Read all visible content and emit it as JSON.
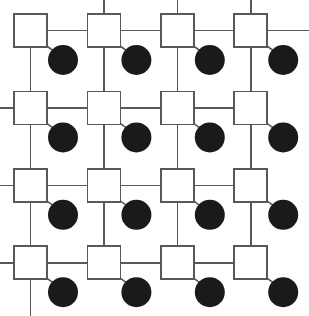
{
  "figure": {
    "type": "node-link-diagram",
    "background_color": "#ffffff",
    "canvas": {
      "width": 309,
      "height": 316
    }
  },
  "style": {
    "line_color": "#58585a",
    "line_width": 1.6,
    "square_fill": "#ffffff",
    "square_stroke": "#58585a",
    "square_stroke_width": 1.7,
    "circle_fill": "#1a1a1a"
  },
  "geometry": {
    "rows": 4,
    "cols": 4,
    "square_size": 33,
    "circle_diameter": 30,
    "origin_x": 14,
    "origin_y": 14,
    "col_pitch": 73.4,
    "row_pitch": 77.4,
    "circle_offset_x": 49,
    "circle_offset_y": 46
  },
  "nodes": {
    "squares": [
      {
        "id": "sq-r1c1",
        "row": 1,
        "col": 1,
        "x": 14,
        "y": 14
      },
      {
        "id": "sq-r1c2",
        "row": 1,
        "col": 2,
        "x": 87.4,
        "y": 14
      },
      {
        "id": "sq-r1c3",
        "row": 1,
        "col": 3,
        "x": 160.8,
        "y": 14
      },
      {
        "id": "sq-r1c4",
        "row": 1,
        "col": 4,
        "x": 234.2,
        "y": 14
      },
      {
        "id": "sq-r2c1",
        "row": 2,
        "col": 1,
        "x": 14,
        "y": 91.4
      },
      {
        "id": "sq-r2c2",
        "row": 2,
        "col": 2,
        "x": 87.4,
        "y": 91.4
      },
      {
        "id": "sq-r2c3",
        "row": 2,
        "col": 3,
        "x": 160.8,
        "y": 91.4
      },
      {
        "id": "sq-r2c4",
        "row": 2,
        "col": 4,
        "x": 234.2,
        "y": 91.4
      },
      {
        "id": "sq-r3c1",
        "row": 3,
        "col": 1,
        "x": 14,
        "y": 168.8
      },
      {
        "id": "sq-r3c2",
        "row": 3,
        "col": 2,
        "x": 87.4,
        "y": 168.8
      },
      {
        "id": "sq-r3c3",
        "row": 3,
        "col": 3,
        "x": 160.8,
        "y": 168.8
      },
      {
        "id": "sq-r3c4",
        "row": 3,
        "col": 4,
        "x": 234.2,
        "y": 168.8
      },
      {
        "id": "sq-r4c1",
        "row": 4,
        "col": 1,
        "x": 14,
        "y": 246.2
      },
      {
        "id": "sq-r4c2",
        "row": 4,
        "col": 2,
        "x": 87.4,
        "y": 246.2
      },
      {
        "id": "sq-r4c3",
        "row": 4,
        "col": 3,
        "x": 160.8,
        "y": 246.2
      },
      {
        "id": "sq-r4c4",
        "row": 4,
        "col": 4,
        "x": 234.2,
        "y": 246.2
      }
    ],
    "circles": [
      {
        "id": "ci-r1c1",
        "row": 1,
        "col": 1,
        "cx": 63,
        "cy": 60
      },
      {
        "id": "ci-r1c2",
        "row": 1,
        "col": 2,
        "cx": 136.4,
        "cy": 60
      },
      {
        "id": "ci-r1c3",
        "row": 1,
        "col": 3,
        "cx": 209.8,
        "cy": 60
      },
      {
        "id": "ci-r1c4",
        "row": 1,
        "col": 4,
        "cx": 283.2,
        "cy": 60
      },
      {
        "id": "ci-r2c1",
        "row": 2,
        "col": 1,
        "cx": 63,
        "cy": 137.4
      },
      {
        "id": "ci-r2c2",
        "row": 2,
        "col": 2,
        "cx": 136.4,
        "cy": 137.4
      },
      {
        "id": "ci-r2c3",
        "row": 2,
        "col": 3,
        "cx": 209.8,
        "cy": 137.4
      },
      {
        "id": "ci-r2c4",
        "row": 2,
        "col": 4,
        "cx": 283.2,
        "cy": 137.4
      },
      {
        "id": "ci-r3c1",
        "row": 3,
        "col": 1,
        "cx": 63,
        "cy": 214.8
      },
      {
        "id": "ci-r3c2",
        "row": 3,
        "col": 2,
        "cx": 136.4,
        "cy": 214.8
      },
      {
        "id": "ci-r3c3",
        "row": 3,
        "col": 3,
        "cx": 209.8,
        "cy": 214.8
      },
      {
        "id": "ci-r3c4",
        "row": 3,
        "col": 4,
        "cx": 283.2,
        "cy": 214.8
      },
      {
        "id": "ci-r4c1",
        "row": 4,
        "col": 1,
        "cx": 63,
        "cy": 292.2
      },
      {
        "id": "ci-r4c2",
        "row": 4,
        "col": 2,
        "cx": 136.4,
        "cy": 292.2
      },
      {
        "id": "ci-r4c3",
        "row": 4,
        "col": 3,
        "cx": 209.8,
        "cy": 292.2
      },
      {
        "id": "ci-r4c4",
        "row": 4,
        "col": 4,
        "cx": 283.2,
        "cy": 292.2
      }
    ]
  },
  "edges": {
    "horizontal": [
      {
        "id": "h-r1c1",
        "x1": 47,
        "y1": 30.5,
        "x2": 87.4,
        "y2": 30.5
      },
      {
        "id": "h-r1c2",
        "x1": 120.4,
        "y1": 30.5,
        "x2": 160.8,
        "y2": 30.5
      },
      {
        "id": "h-r1c3",
        "x1": 193.8,
        "y1": 30.5,
        "x2": 234.2,
        "y2": 30.5
      },
      {
        "id": "h-r1c4",
        "x1": 267.2,
        "y1": 30.5,
        "x2": 309,
        "y2": 30.5
      },
      {
        "id": "h-r2c0",
        "x1": 0,
        "y1": 107.9,
        "x2": 14,
        "y2": 107.9
      },
      {
        "id": "h-r2c1",
        "x1": 47,
        "y1": 107.9,
        "x2": 87.4,
        "y2": 107.9
      },
      {
        "id": "h-r2c2",
        "x1": 120.4,
        "y1": 107.9,
        "x2": 160.8,
        "y2": 107.9
      },
      {
        "id": "h-r2c3",
        "x1": 193.8,
        "y1": 107.9,
        "x2": 234.2,
        "y2": 107.9
      },
      {
        "id": "h-r3c0",
        "x1": 0,
        "y1": 185.3,
        "x2": 14,
        "y2": 185.3
      },
      {
        "id": "h-r3c1",
        "x1": 47,
        "y1": 185.3,
        "x2": 87.4,
        "y2": 185.3
      },
      {
        "id": "h-r3c2",
        "x1": 120.4,
        "y1": 185.3,
        "x2": 160.8,
        "y2": 185.3
      },
      {
        "id": "h-r3c3",
        "x1": 193.8,
        "y1": 185.3,
        "x2": 234.2,
        "y2": 185.3
      },
      {
        "id": "h-r4c0",
        "x1": 0,
        "y1": 262.7,
        "x2": 14,
        "y2": 262.7
      },
      {
        "id": "h-r4c1",
        "x1": 47,
        "y1": 262.7,
        "x2": 87.4,
        "y2": 262.7
      },
      {
        "id": "h-r4c2",
        "x1": 120.4,
        "y1": 262.7,
        "x2": 160.8,
        "y2": 262.7
      },
      {
        "id": "h-r4c3",
        "x1": 193.8,
        "y1": 262.7,
        "x2": 234.2,
        "y2": 262.7
      }
    ],
    "vertical": [
      {
        "id": "v-c1r1",
        "x1": 30.5,
        "y1": 47,
        "x2": 30.5,
        "y2": 91.4
      },
      {
        "id": "v-c1r2",
        "x1": 30.5,
        "y1": 124.4,
        "x2": 30.5,
        "y2": 168.8
      },
      {
        "id": "v-c1r3",
        "x1": 30.5,
        "y1": 201.8,
        "x2": 30.5,
        "y2": 246.2
      },
      {
        "id": "v-c1r4",
        "x1": 30.5,
        "y1": 279.2,
        "x2": 30.5,
        "y2": 316
      },
      {
        "id": "v-c2r0",
        "x1": 103.9,
        "y1": 0,
        "x2": 103.9,
        "y2": 14
      },
      {
        "id": "v-c2r1",
        "x1": 103.9,
        "y1": 47,
        "x2": 103.9,
        "y2": 91.4
      },
      {
        "id": "v-c2r2",
        "x1": 103.9,
        "y1": 124.4,
        "x2": 103.9,
        "y2": 168.8
      },
      {
        "id": "v-c2r3",
        "x1": 103.9,
        "y1": 201.8,
        "x2": 103.9,
        "y2": 246.2
      },
      {
        "id": "v-c3r0",
        "x1": 177.3,
        "y1": 0,
        "x2": 177.3,
        "y2": 14
      },
      {
        "id": "v-c3r1",
        "x1": 177.3,
        "y1": 47,
        "x2": 177.3,
        "y2": 91.4
      },
      {
        "id": "v-c3r2",
        "x1": 177.3,
        "y1": 124.4,
        "x2": 177.3,
        "y2": 168.8
      },
      {
        "id": "v-c3r3",
        "x1": 177.3,
        "y1": 201.8,
        "x2": 177.3,
        "y2": 246.2
      },
      {
        "id": "v-c4r0",
        "x1": 250.7,
        "y1": 0,
        "x2": 250.7,
        "y2": 14
      },
      {
        "id": "v-c4r1",
        "x1": 250.7,
        "y1": 47,
        "x2": 250.7,
        "y2": 91.4
      },
      {
        "id": "v-c4r2",
        "x1": 250.7,
        "y1": 124.4,
        "x2": 250.7,
        "y2": 168.8
      },
      {
        "id": "v-c4r3",
        "x1": 250.7,
        "y1": 201.8,
        "x2": 250.7,
        "y2": 246.2
      }
    ],
    "diagonal": [
      {
        "id": "d-r1c1",
        "x1": 44,
        "y1": 44,
        "x2": 55,
        "y2": 52
      },
      {
        "id": "d-r1c2",
        "x1": 117.4,
        "y1": 44,
        "x2": 128.4,
        "y2": 52
      },
      {
        "id": "d-r1c3",
        "x1": 190.8,
        "y1": 44,
        "x2": 201.8,
        "y2": 52
      },
      {
        "id": "d-r1c4",
        "x1": 264.2,
        "y1": 44,
        "x2": 275.2,
        "y2": 52
      },
      {
        "id": "d-r2c1",
        "x1": 44,
        "y1": 121.4,
        "x2": 55,
        "y2": 129.4
      },
      {
        "id": "d-r2c2",
        "x1": 117.4,
        "y1": 121.4,
        "x2": 128.4,
        "y2": 129.4
      },
      {
        "id": "d-r2c3",
        "x1": 190.8,
        "y1": 121.4,
        "x2": 201.8,
        "y2": 129.4
      },
      {
        "id": "d-r2c4",
        "x1": 264.2,
        "y1": 121.4,
        "x2": 275.2,
        "y2": 129.4
      },
      {
        "id": "d-r3c1",
        "x1": 44,
        "y1": 198.8,
        "x2": 55,
        "y2": 206.8
      },
      {
        "id": "d-r3c2",
        "x1": 117.4,
        "y1": 198.8,
        "x2": 128.4,
        "y2": 206.8
      },
      {
        "id": "d-r3c3",
        "x1": 190.8,
        "y1": 198.8,
        "x2": 201.8,
        "y2": 206.8
      },
      {
        "id": "d-r3c4",
        "x1": 264.2,
        "y1": 198.8,
        "x2": 275.2,
        "y2": 206.8
      },
      {
        "id": "d-r4c1",
        "x1": 44,
        "y1": 276.2,
        "x2": 55,
        "y2": 284.2
      },
      {
        "id": "d-r4c2",
        "x1": 117.4,
        "y1": 276.2,
        "x2": 128.4,
        "y2": 284.2
      },
      {
        "id": "d-r4c3",
        "x1": 190.8,
        "y1": 276.2,
        "x2": 201.8,
        "y2": 284.2
      },
      {
        "id": "d-r4c4",
        "x1": 264.2,
        "y1": 276.2,
        "x2": 275.2,
        "y2": 284.2
      }
    ]
  }
}
